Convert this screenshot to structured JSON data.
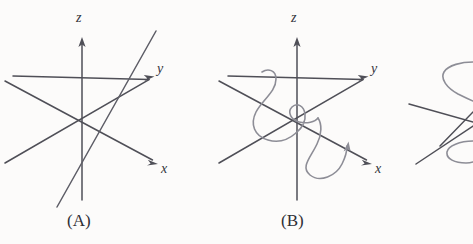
{
  "figure": {
    "width": 473,
    "height": 244,
    "background_color": "#fcfbfa",
    "axis_color": "#4f4f57",
    "curve_color": "#8d8d96",
    "line_color": "#5d5d66",
    "text_color": "#2e2e35"
  },
  "panels": [
    {
      "id": "A",
      "caption": "(A)",
      "caption_pos": {
        "x": 67,
        "y": 212
      },
      "origin": {
        "x": 82,
        "y": 122
      },
      "axes": [
        {
          "name": "z",
          "label": "z",
          "label_pos": {
            "x": 76,
            "y": 11
          },
          "positive_tip": {
            "x": 82,
            "y": 38
          },
          "negative_end": {
            "x": 82,
            "y": 200
          }
        },
        {
          "name": "y",
          "label": "y",
          "label_pos": {
            "x": 157,
            "y": 62
          },
          "positive_tip": {
            "x": 153,
            "y": 77
          },
          "negative_end": {
            "x": 13,
            "y": 76
          }
        },
        {
          "name": "x",
          "label": "x",
          "label_pos": {
            "x": 161,
            "y": 162
          },
          "positive_tip": {
            "x": 157,
            "y": 163
          },
          "negative_end": {
            "x": 5,
            "y": 163
          }
        }
      ],
      "overlay": {
        "type": "straight-line",
        "description": "single straight solution line through origin",
        "from": {
          "x": 57,
          "y": 207
        },
        "to": {
          "x": 156,
          "y": 31
        }
      }
    },
    {
      "id": "B",
      "caption": "(B)",
      "caption_pos": {
        "x": 281,
        "y": 212
      },
      "origin": {
        "x": 297,
        "y": 122
      },
      "axes": [
        {
          "name": "z",
          "label": "z",
          "label_pos": {
            "x": 291,
            "y": 11
          },
          "positive_tip": {
            "x": 297,
            "y": 38
          },
          "negative_end": {
            "x": 297,
            "y": 200
          }
        },
        {
          "name": "y",
          "label": "y",
          "label_pos": {
            "x": 371,
            "y": 62
          },
          "positive_tip": {
            "x": 367,
            "y": 77
          },
          "negative_end": {
            "x": 228,
            "y": 76
          }
        },
        {
          "name": "x",
          "label": "x",
          "label_pos": {
            "x": 375,
            "y": 162
          },
          "positive_tip": {
            "x": 371,
            "y": 163
          },
          "negative_end": {
            "x": 219,
            "y": 163
          }
        }
      ],
      "overlay": {
        "type": "spiral-curve",
        "description": "helical spiral curve winding around the origin"
      }
    },
    {
      "id": "C",
      "caption": "",
      "clipped": true,
      "description": "third panel cut off at the right edge showing partial curve loops and straight lines"
    }
  ]
}
